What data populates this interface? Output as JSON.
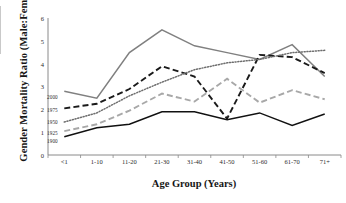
{
  "figure": {
    "ylabel": "Gender Mortality Ratio (Male:Fema",
    "xlabel": "Age Group (Years)"
  },
  "chart_data": {
    "type": "line",
    "title": "",
    "xlabel": "Age Group (Years)",
    "ylabel": "Gender Mortality Ratio (Male:Fema",
    "categories": [
      "<1",
      "1-10",
      "11-20",
      "21-30",
      "31-40",
      "41-50",
      "51-60",
      "61-70",
      "71+"
    ],
    "ylim": [
      0,
      6
    ],
    "yticks": [
      0,
      1,
      2,
      3,
      4,
      5,
      6
    ],
    "ytick_labels": [
      "0",
      "1",
      "2",
      "3",
      "4",
      "5",
      "6"
    ],
    "grid": false,
    "legend_position": "inline-left",
    "series": [
      {
        "name": "2000",
        "color": "#808080",
        "style": "solid",
        "values": [
          2.8,
          2.5,
          4.5,
          5.5,
          4.8,
          4.5,
          4.2,
          4.85,
          3.45
        ]
      },
      {
        "name": "1975",
        "color": "#1a1a1a",
        "style": "dashed",
        "values": [
          2.05,
          2.25,
          2.9,
          3.9,
          3.45,
          1.6,
          4.4,
          4.3,
          3.6
        ]
      },
      {
        "name": "1950",
        "color": "#6e6e6e",
        "style": "dotted",
        "values": [
          1.45,
          1.85,
          2.6,
          3.2,
          3.75,
          4.05,
          4.2,
          4.5,
          4.6
        ]
      },
      {
        "name": "1925",
        "color": "#a8a8a8",
        "style": "dashed",
        "values": [
          1.05,
          1.35,
          1.95,
          2.7,
          2.35,
          3.35,
          2.3,
          2.85,
          2.45
        ]
      },
      {
        "name": "1900",
        "color": "#111111",
        "style": "solid",
        "values": [
          0.8,
          1.2,
          1.35,
          1.9,
          1.9,
          1.55,
          1.85,
          1.3,
          1.8
        ]
      }
    ],
    "series_labels": [
      {
        "name": "2000",
        "x": 47,
        "y": 94
      },
      {
        "name": "1975",
        "x": 47,
        "y": 107
      },
      {
        "name": "1950",
        "x": 47,
        "y": 119
      },
      {
        "name": "1925",
        "x": 47,
        "y": 130
      },
      {
        "name": "1900",
        "x": 47,
        "y": 138
      }
    ]
  }
}
